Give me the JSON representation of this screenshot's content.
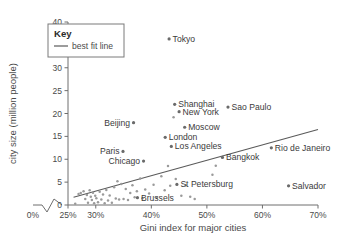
{
  "chart_data": {
    "type": "scatter",
    "title": "",
    "xlabel": "Gini index for major cities",
    "ylabel": "city size (million people)",
    "xlim": [
      25,
      70
    ],
    "ylim": [
      0,
      40
    ],
    "x_tick_labels": [
      "0%",
      "25%",
      "30%",
      "40%",
      "50%",
      "60%",
      "70%"
    ],
    "x_tick_values": [
      0,
      25,
      30,
      40,
      50,
      60,
      70
    ],
    "y_tick_labels": [
      "0",
      "5",
      "10",
      "15",
      "20",
      "25",
      "30",
      "35",
      "40"
    ],
    "y_tick_values": [
      0,
      5,
      10,
      15,
      20,
      25,
      30,
      35,
      40
    ],
    "axis_break": true,
    "grid": false,
    "legend_position": "top-left",
    "legend": {
      "title": "Key",
      "entries": [
        {
          "label": "best fit line",
          "marker": "line",
          "color": "#5a5a5a"
        }
      ]
    },
    "best_fit_line": {
      "x_start": 26.0,
      "y_start": 1.7,
      "x_end": 70.0,
      "y_end": 16.5
    },
    "labeled_points": [
      {
        "name": "Tokyo",
        "x": 43.2,
        "y": 36.3,
        "label_side": "right"
      },
      {
        "name": "Shanghai",
        "x": 44.2,
        "y": 22.0,
        "label_side": "right"
      },
      {
        "name": "Sao Paulo",
        "x": 53.8,
        "y": 21.4,
        "label_side": "right"
      },
      {
        "name": "New York",
        "x": 45.0,
        "y": 20.4,
        "label_side": "right"
      },
      {
        "name": "Moscow",
        "x": 46.0,
        "y": 17.0,
        "label_side": "right"
      },
      {
        "name": "Beijing",
        "x": 36.8,
        "y": 18.0,
        "label_side": "left"
      },
      {
        "name": "London",
        "x": 42.5,
        "y": 14.8,
        "label_side": "right"
      },
      {
        "name": "Los Angeles",
        "x": 43.6,
        "y": 12.8,
        "label_side": "right"
      },
      {
        "name": "Rio de Janeiro",
        "x": 61.6,
        "y": 12.5,
        "label_side": "right"
      },
      {
        "name": "Paris",
        "x": 34.9,
        "y": 11.7,
        "label_side": "left"
      },
      {
        "name": "Bangkok",
        "x": 52.8,
        "y": 10.4,
        "label_side": "right"
      },
      {
        "name": "Chicago",
        "x": 38.6,
        "y": 9.6,
        "label_side": "left"
      },
      {
        "name": "St Petersburg",
        "x": 44.6,
        "y": 4.5,
        "label_side": "right"
      },
      {
        "name": "Salvador",
        "x": 64.7,
        "y": 4.2,
        "label_side": "right"
      },
      {
        "name": "Brussels",
        "x": 37.5,
        "y": 1.6,
        "label_side": "right"
      }
    ],
    "unlabeled_points": [
      {
        "x": 26.3,
        "y": 0.3
      },
      {
        "x": 26.9,
        "y": 2.4
      },
      {
        "x": 27.3,
        "y": 2.6
      },
      {
        "x": 27.8,
        "y": 3.0
      },
      {
        "x": 28.1,
        "y": 1.3
      },
      {
        "x": 28.4,
        "y": 2.2
      },
      {
        "x": 28.6,
        "y": 0.5
      },
      {
        "x": 28.9,
        "y": 3.2
      },
      {
        "x": 29.1,
        "y": 1.8
      },
      {
        "x": 29.3,
        "y": 1.1
      },
      {
        "x": 29.5,
        "y": 2.7
      },
      {
        "x": 29.7,
        "y": 0.4
      },
      {
        "x": 29.9,
        "y": 2.0
      },
      {
        "x": 30.1,
        "y": 1.5
      },
      {
        "x": 30.4,
        "y": 0.6
      },
      {
        "x": 30.7,
        "y": 2.9
      },
      {
        "x": 31.0,
        "y": 1.2
      },
      {
        "x": 31.3,
        "y": 2.3
      },
      {
        "x": 31.6,
        "y": 0.4
      },
      {
        "x": 31.9,
        "y": 3.3
      },
      {
        "x": 32.2,
        "y": 1.0
      },
      {
        "x": 32.5,
        "y": 2.1
      },
      {
        "x": 32.9,
        "y": 0.5
      },
      {
        "x": 33.3,
        "y": 3.9
      },
      {
        "x": 33.6,
        "y": 1.4
      },
      {
        "x": 33.9,
        "y": 5.2
      },
      {
        "x": 34.2,
        "y": 1.2
      },
      {
        "x": 34.6,
        "y": 4.6
      },
      {
        "x": 35.0,
        "y": 1.3
      },
      {
        "x": 35.4,
        "y": 3.5
      },
      {
        "x": 35.8,
        "y": 1.1
      },
      {
        "x": 36.2,
        "y": 2.6
      },
      {
        "x": 36.6,
        "y": 4.3
      },
      {
        "x": 37.0,
        "y": 1.7
      },
      {
        "x": 37.4,
        "y": 3.0
      },
      {
        "x": 38.0,
        "y": 5.8
      },
      {
        "x": 38.4,
        "y": 1.5
      },
      {
        "x": 38.9,
        "y": 3.4
      },
      {
        "x": 39.6,
        "y": 2.5
      },
      {
        "x": 40.4,
        "y": 4.4
      },
      {
        "x": 41.0,
        "y": 1.6
      },
      {
        "x": 41.8,
        "y": 6.3
      },
      {
        "x": 42.4,
        "y": 3.2
      },
      {
        "x": 43.0,
        "y": 8.5
      },
      {
        "x": 43.4,
        "y": 4.2
      },
      {
        "x": 44.0,
        "y": 19.2
      },
      {
        "x": 44.4,
        "y": 5.7
      },
      {
        "x": 45.4,
        "y": 2.0
      },
      {
        "x": 46.2,
        "y": 4.3
      },
      {
        "x": 47.0,
        "y": 1.8
      },
      {
        "x": 47.8,
        "y": 1.3
      },
      {
        "x": 51.6,
        "y": 8.6
      },
      {
        "x": 51.0,
        "y": 6.6
      }
    ]
  }
}
